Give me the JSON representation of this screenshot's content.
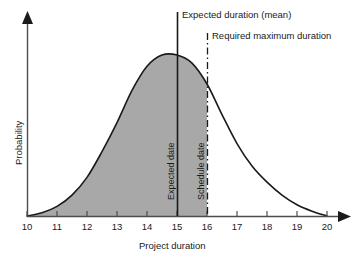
{
  "chart_data": {
    "type": "area",
    "title": "",
    "xlabel": "Project duration",
    "ylabel": "Probability",
    "xlim": [
      10,
      20
    ],
    "ylim": [
      0,
      1
    ],
    "grid": false,
    "legend": "none",
    "x_tick_labels": [
      "10",
      "11",
      "12",
      "13",
      "14",
      "15",
      "16",
      "17",
      "18",
      "19",
      "20"
    ],
    "x_ticks": [
      10,
      11,
      12,
      13,
      14,
      15,
      16,
      17,
      18,
      19,
      20
    ],
    "y_tick_labels": [],
    "series": [
      {
        "name": "Project duration probability distribution",
        "type": "line",
        "fill_to_x": 16,
        "x": [
          10.0,
          10.5,
          11.0,
          11.5,
          12.0,
          12.5,
          13.0,
          13.5,
          14.0,
          14.5,
          15.0,
          15.5,
          16.0,
          16.5,
          17.0,
          17.5,
          18.0,
          18.5,
          19.0,
          19.5,
          20.0
        ],
        "y": [
          0.0,
          0.02,
          0.06,
          0.13,
          0.24,
          0.4,
          0.58,
          0.78,
          0.93,
          1.0,
          1.0,
          0.95,
          0.82,
          0.63,
          0.45,
          0.31,
          0.21,
          0.13,
          0.07,
          0.03,
          0.0
        ]
      }
    ],
    "annotations": [
      {
        "name": "expected-duration-line",
        "x": 15,
        "style": "solid",
        "callout": "Expected duration (mean)",
        "inline_label": "Expected date"
      },
      {
        "name": "required-maximum-duration-line",
        "x": 16,
        "style": "dash-dot",
        "callout": "Required maximum duration",
        "inline_label": "Schedule date"
      }
    ],
    "colors": {
      "fill": "#a8a8a8",
      "curve": "#1a1a1a",
      "axis": "#4d4d4d",
      "text": "#1a1a1a"
    }
  },
  "labels": {
    "expected_duration_callout": "Expected duration (mean)",
    "required_maximum_callout": "Required maximum duration",
    "expected_date": "Expected date",
    "schedule_date": "Schedule date",
    "x_axis_title": "Project duration",
    "y_axis_title": "Probability"
  }
}
